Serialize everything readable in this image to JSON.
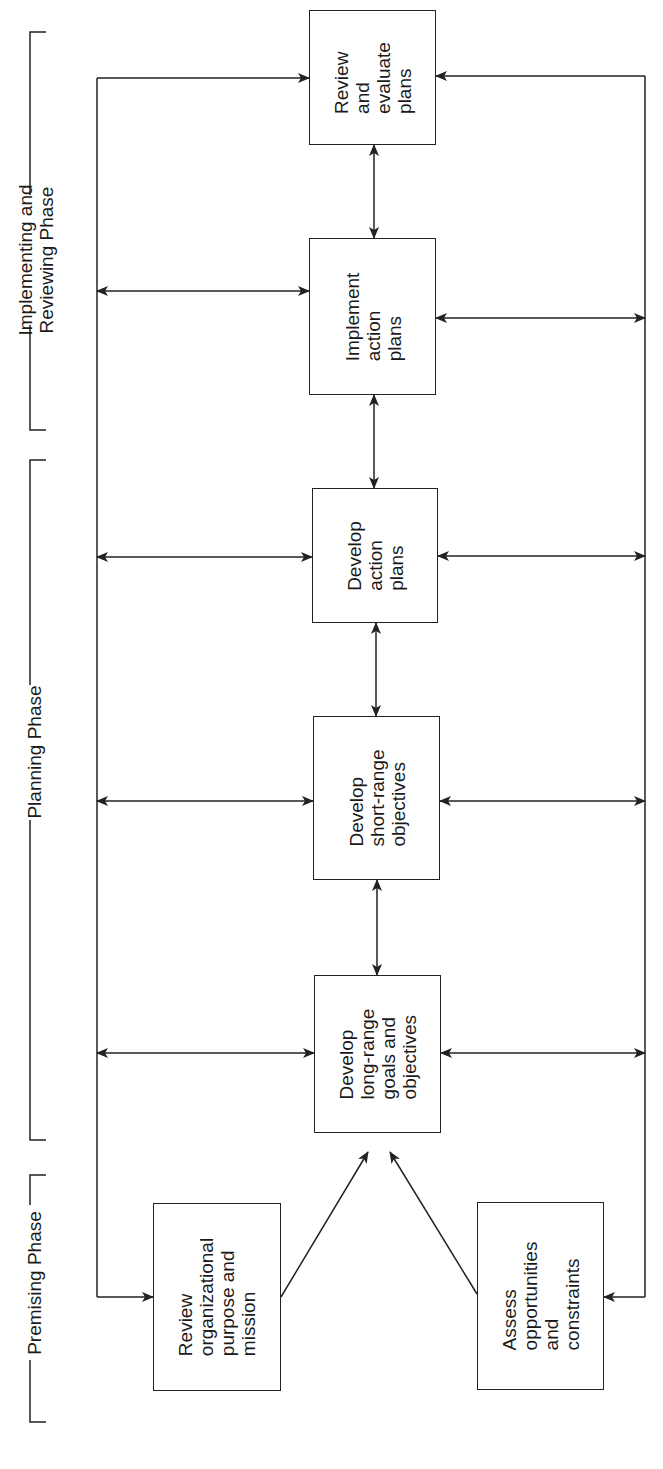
{
  "phases": [
    {
      "id": "implementing",
      "label": "Implementing and\nReviewing Phase"
    },
    {
      "id": "planning",
      "label": "Planning Phase"
    },
    {
      "id": "premising",
      "label": "Premising Phase"
    }
  ],
  "boxes": {
    "review_evaluate": "Review\nand\nevaluate\nplans",
    "implement": "Implement\naction\nplans",
    "develop_action": "Develop\naction\nplans",
    "develop_short": "Develop\nshort-range\nobjectives",
    "develop_long": "Develop\nlong-range\ngoals and\nobjectives",
    "review_org": "Review\norganizational\npurpose and\nmission",
    "assess": "Assess\nopportunities\nand\nconstraints"
  },
  "colors": {
    "line": "#222222",
    "background": "#ffffff"
  }
}
